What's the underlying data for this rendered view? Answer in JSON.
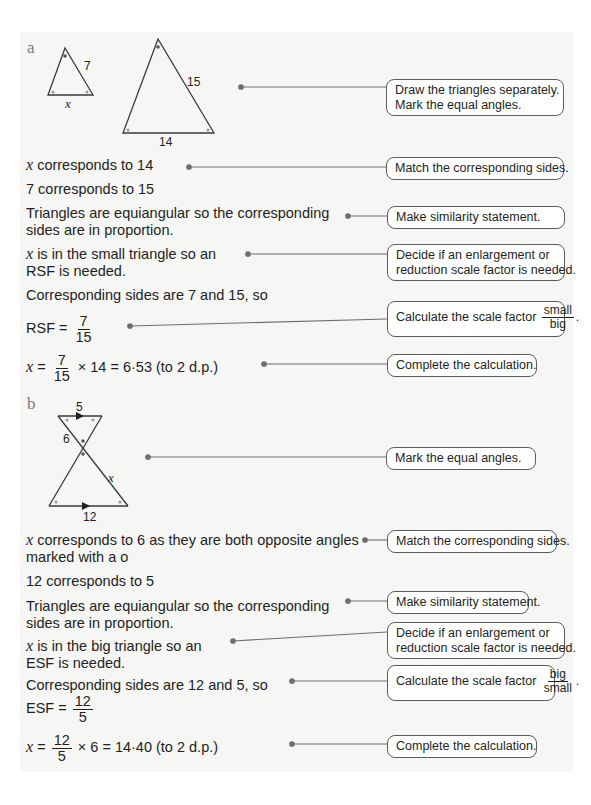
{
  "part_a": {
    "label": "a",
    "figure": {
      "small_triangle": {
        "side_label": "7",
        "base_label": "x"
      },
      "large_triangle": {
        "side_label": "15",
        "base_label": "14"
      }
    },
    "steps": [
      {
        "text": "x corresponds to 14",
        "var": "x",
        "rest": " corresponds to 14"
      },
      {
        "text": "7 corresponds to 15"
      },
      {
        "line1": "Triangles are equiangular so the corresponding",
        "line2": "sides are in proportion."
      },
      {
        "var": "x",
        "line1_rest": " is in the small triangle so an",
        "line2": "RSF is needed."
      },
      {
        "text": "Corresponding sides are 7 and 15, so"
      },
      {
        "prefix": "RSF = ",
        "num": "7",
        "den": "15"
      },
      {
        "var": "x",
        "eq": " = ",
        "num": "7",
        "den": "15",
        "rest": " × 14 = 6·53 (to 2 d.p.)"
      }
    ],
    "notes": [
      {
        "line1": "Draw the triangles separately.",
        "line2": "Mark the equal angles."
      },
      {
        "text": "Match the corresponding sides."
      },
      {
        "text": "Make similarity statement."
      },
      {
        "line1": "Decide if an enlargement or",
        "line2": "reduction scale factor is needed."
      },
      {
        "text": "Calculate the scale factor",
        "num": "small",
        "den": "big",
        "end": "."
      },
      {
        "text": "Complete the calculation."
      }
    ]
  },
  "part_b": {
    "label": "b",
    "figure": {
      "top_label": "5",
      "left_label": "6",
      "right_label": "x",
      "bottom_label": "12"
    },
    "steps": [
      {
        "var": "x",
        "line1_rest": " corresponds to 6 as they are both opposite angles",
        "line2": "marked with a o"
      },
      {
        "text": "12 corresponds to 5"
      },
      {
        "line1": "Triangles are equiangular so the corresponding",
        "line2": "sides are in proportion."
      },
      {
        "var": "x",
        "line1_rest": " is in the big triangle so an",
        "line2": "ESF is needed."
      },
      {
        "text": "Corresponding sides are 12 and 5, so"
      },
      {
        "prefix": "ESF = ",
        "num": "12",
        "den": "5"
      },
      {
        "var": "x",
        "eq": " = ",
        "num": "12",
        "den": "5",
        "rest": " × 6 = 14·40 (to 2 d.p.)"
      }
    ],
    "notes": [
      {
        "text": "Mark the equal angles."
      },
      {
        "text": "Match the corresponding sides."
      },
      {
        "text": "Make similarity statement."
      },
      {
        "line1": "Decide if an enlargement or",
        "line2": "reduction scale factor is needed."
      },
      {
        "text": "Calculate the scale factor",
        "num": "big",
        "den": "small",
        "end": "."
      },
      {
        "text": "Complete the calculation."
      }
    ]
  },
  "colors": {
    "panel_bg": "#f6f6f5",
    "line": "#6e6e6e",
    "dot": "#6e6e6e",
    "label_grey": "#7a7a7a"
  }
}
